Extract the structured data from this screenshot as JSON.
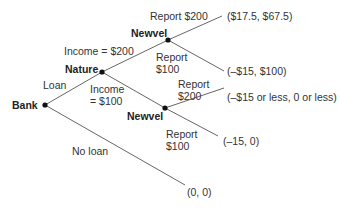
{
  "diagram": {
    "type": "game-tree",
    "nodes": [
      {
        "id": "bank",
        "label": "Bank"
      },
      {
        "id": "nature",
        "label": "Nature"
      },
      {
        "id": "newvel_high",
        "label": "Newvel"
      },
      {
        "id": "newvel_low",
        "label": "Newvel"
      }
    ],
    "edges": {
      "loan": "Loan",
      "no_loan": "No loan",
      "income_200": "Income = $200",
      "income_100_line1": "Income",
      "income_100_line2": "= $100",
      "high_report_200": "Report $200",
      "high_report_100_line1": "Report",
      "high_report_100_line2": "$100",
      "low_report_200_line1": "Report",
      "low_report_200_line2": "$200",
      "low_report_100_line1": "Report",
      "low_report_100_line2": "$100"
    },
    "payoffs": {
      "high_200": "($17.5, $67.5)",
      "high_100": "(–$15, $100)",
      "low_200": "(–$15 or less, 0 or less)",
      "low_100": "(–15, 0)",
      "no_loan": "(0, 0)"
    }
  }
}
